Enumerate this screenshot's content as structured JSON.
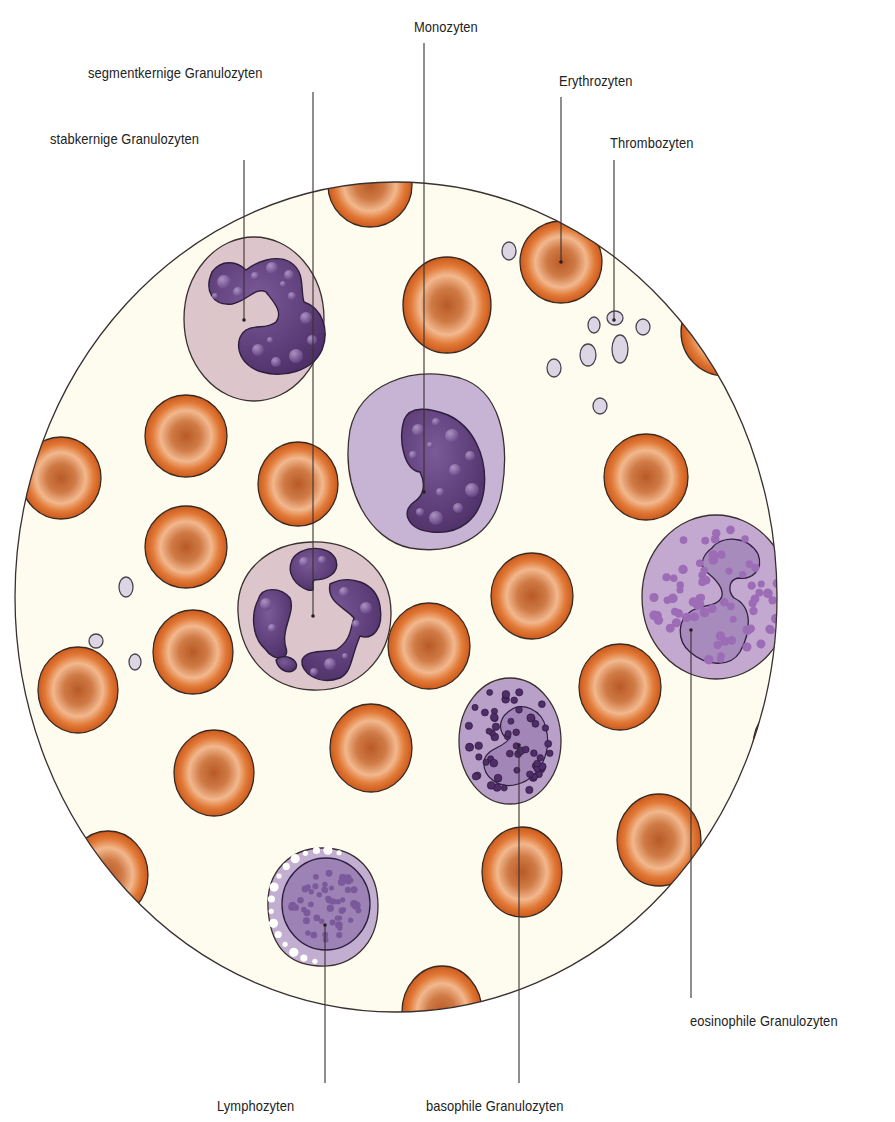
{
  "colors": {
    "background": "#ffffff",
    "smear": "#fdfcef",
    "outline": "#3a3030",
    "erythrocyte_rim": "#d7621f",
    "erythrocyte_center": "#c2622b",
    "erythrocyte_highlight": "#f0b48a",
    "neutrophil_cytoplasm": "#dcc6cb",
    "nucleus_dark": "#5a3a78",
    "monocyte_cytoplasm": "#c7b4d4",
    "eosinophil_cytoplasm": "#c3a8cf",
    "eosinophil_granule": "#9c6cb6",
    "basophil_cytoplasm": "#b8a0c8",
    "basophil_granule": "#4e2d69",
    "lymphocyte_cytoplasm": "#c2aed0",
    "lymphocyte_nucleus": "#9d82b6",
    "platelet": "#dcd6e4"
  },
  "smear": {
    "cx": 396,
    "cy": 597,
    "rx": 381,
    "ry": 415
  },
  "labels": [
    {
      "id": "monozyten",
      "text": "Monozyten",
      "x": 414,
      "y": 18,
      "line_x": 424,
      "line_top": 43,
      "dot_x": 424,
      "dot_y": 492
    },
    {
      "id": "segmentkernige",
      "text": "segmentkernige Granulozyten",
      "x": 88,
      "y": 64,
      "line_x": 313,
      "line_top": 92,
      "dot_x": 313,
      "dot_y": 616
    },
    {
      "id": "stabkernige",
      "text": "stabkernige Granulozyten",
      "x": 50,
      "y": 130,
      "line_x": 244,
      "line_top": 160,
      "dot_x": 244,
      "dot_y": 320
    },
    {
      "id": "erythrozyten",
      "text": "Erythrozyten",
      "x": 559,
      "y": 72,
      "line_x": 561,
      "line_top": 97,
      "dot_x": 561,
      "dot_y": 262
    },
    {
      "id": "thrombozyten",
      "text": "Thrombozyten",
      "x": 610,
      "y": 134,
      "line_x": 614,
      "line_top": 160,
      "dot_x": 614,
      "dot_y": 320
    },
    {
      "id": "eosinophile",
      "text": "eosinophile Granulozyten",
      "x": 690,
      "y": 1012,
      "line_x": 691,
      "line_top": 630,
      "line_bottom": 998,
      "dot_x": 691,
      "dot_y": 630
    },
    {
      "id": "lymphozyten",
      "text": "Lymphozyten",
      "x": 217,
      "y": 1097,
      "line_x": 325,
      "line_top": 925,
      "line_bottom": 1083,
      "dot_x": 325,
      "dot_y": 925
    },
    {
      "id": "basophile",
      "text": "basophile Granulozyten",
      "x": 426,
      "y": 1097,
      "line_x": 519,
      "line_top": 745,
      "line_bottom": 1083,
      "dot_x": 519,
      "dot_y": 745
    }
  ],
  "erythrocytes": [
    {
      "cx": 370,
      "cy": 185,
      "rx": 42,
      "ry": 42
    },
    {
      "cx": 561,
      "cy": 262,
      "rx": 41,
      "ry": 41
    },
    {
      "cx": 447,
      "cy": 305,
      "rx": 44,
      "ry": 48
    },
    {
      "cx": 725,
      "cy": 332,
      "rx": 44,
      "ry": 44
    },
    {
      "cx": 186,
      "cy": 436,
      "rx": 41,
      "ry": 41
    },
    {
      "cx": 61,
      "cy": 478,
      "rx": 40,
      "ry": 41
    },
    {
      "cx": 298,
      "cy": 484,
      "rx": 40,
      "ry": 42
    },
    {
      "cx": 646,
      "cy": 477,
      "rx": 42,
      "ry": 43
    },
    {
      "cx": 186,
      "cy": 547,
      "rx": 41,
      "ry": 41
    },
    {
      "cx": 532,
      "cy": 596,
      "rx": 41,
      "ry": 43
    },
    {
      "cx": 193,
      "cy": 652,
      "rx": 40,
      "ry": 42
    },
    {
      "cx": 429,
      "cy": 646,
      "rx": 41,
      "ry": 43
    },
    {
      "cx": 78,
      "cy": 690,
      "rx": 40,
      "ry": 43
    },
    {
      "cx": 620,
      "cy": 687,
      "rx": 41,
      "ry": 43
    },
    {
      "cx": 371,
      "cy": 748,
      "rx": 41,
      "ry": 44
    },
    {
      "cx": 214,
      "cy": 773,
      "rx": 40,
      "ry": 43
    },
    {
      "cx": 793,
      "cy": 746,
      "rx": 40,
      "ry": 44
    },
    {
      "cx": 659,
      "cy": 840,
      "rx": 42,
      "ry": 46
    },
    {
      "cx": 522,
      "cy": 872,
      "rx": 40,
      "ry": 45
    },
    {
      "cx": 108,
      "cy": 875,
      "rx": 40,
      "ry": 44
    },
    {
      "cx": 442,
      "cy": 1012,
      "rx": 40,
      "ry": 46
    }
  ],
  "platelets": [
    {
      "cx": 509,
      "cy": 251,
      "rx": 7,
      "ry": 9
    },
    {
      "cx": 594,
      "cy": 325,
      "rx": 6,
      "ry": 8
    },
    {
      "cx": 615,
      "cy": 318,
      "rx": 8,
      "ry": 7
    },
    {
      "cx": 643,
      "cy": 327,
      "rx": 7,
      "ry": 8
    },
    {
      "cx": 588,
      "cy": 355,
      "rx": 8,
      "ry": 11
    },
    {
      "cx": 620,
      "cy": 349,
      "rx": 8,
      "ry": 14
    },
    {
      "cx": 554,
      "cy": 368,
      "rx": 7,
      "ry": 9
    },
    {
      "cx": 600,
      "cy": 406,
      "rx": 7,
      "ry": 8
    },
    {
      "cx": 126,
      "cy": 587,
      "rx": 7,
      "ry": 10
    },
    {
      "cx": 96,
      "cy": 641,
      "rx": 7,
      "ry": 7
    },
    {
      "cx": 135,
      "cy": 662,
      "rx": 6,
      "ry": 8
    }
  ],
  "leukocytes": {
    "stabkernige": {
      "cx": 254,
      "cy": 319,
      "rx": 70,
      "ry": 82
    },
    "monozyt": {
      "cx": 424,
      "cy": 453,
      "rx": 80,
      "ry": 95
    },
    "segmentkernige": {
      "cx": 313,
      "cy": 617,
      "rx": 78,
      "ry": 75
    },
    "eosinophil": {
      "cx": 716,
      "cy": 597,
      "rx": 74,
      "ry": 82
    },
    "basophil": {
      "cx": 510,
      "cy": 741,
      "rx": 51,
      "ry": 63
    },
    "lymphozyt": {
      "cx": 318,
      "cy": 906,
      "rx": 54,
      "ry": 60
    }
  }
}
